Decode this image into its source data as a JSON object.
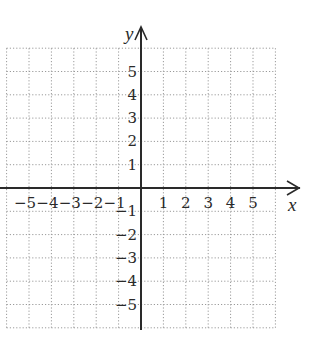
{
  "chart_data": {
    "type": "coordinate-grid",
    "title": "",
    "xlabel": "x",
    "ylabel": "y",
    "xlim": [
      -6,
      6
    ],
    "ylim": [
      -6,
      6
    ],
    "grid": true,
    "grid_style": "dotted",
    "x_tick_labels": [
      "−5",
      "−4",
      "−3",
      "−2",
      "−1",
      "1",
      "2",
      "3",
      "4",
      "5"
    ],
    "x_ticks": [
      -5,
      -4,
      -3,
      -2,
      -1,
      1,
      2,
      3,
      4,
      5
    ],
    "y_tick_labels": [
      "5",
      "4",
      "3",
      "2",
      "1",
      "−1",
      "−2",
      "−3",
      "−4",
      "−5"
    ],
    "y_ticks": [
      5,
      4,
      3,
      2,
      1,
      -1,
      -2,
      -3,
      -4,
      -5
    ],
    "series": []
  },
  "axes": {
    "x_name": "x",
    "y_name": "y"
  },
  "colors": {
    "axis": "#2a2a2a",
    "grid": "#9a9a9a",
    "text": "#2a2a2a",
    "background": "#ffffff"
  }
}
